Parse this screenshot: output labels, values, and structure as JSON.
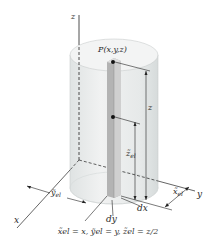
{
  "figure": {
    "type": "3d-diagram",
    "labels": {
      "point": "P(x,y,z)",
      "z_axis": "z",
      "x_axis": "x",
      "y_axis": "y",
      "z_length": "z",
      "z_el": "z̃",
      "z_el_sub": "el",
      "x_el": "x̃",
      "x_el_sub": "el",
      "y_el": "ỹ",
      "y_el_sub": "el",
      "dx": "dx",
      "dy": "dy"
    },
    "formula": {
      "text": "x̃el = x, ỹel = y, z̃el = z/2"
    },
    "colors": {
      "cylinder_fill": "#e9ecec",
      "cylinder_top": "#f2f3f3",
      "column_front": "#a9a9a9",
      "column_side": "#c8c8c8",
      "lines": "#222222"
    }
  }
}
